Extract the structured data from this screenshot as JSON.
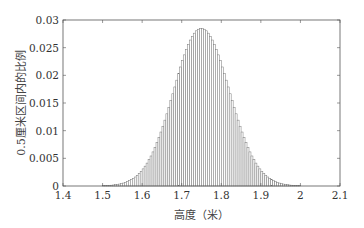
{
  "chart_data": {
    "type": "bar",
    "title": "",
    "xlabel": "高度（米）",
    "ylabel": "0.5厘米区间内的比例",
    "xlim": [
      1.4,
      2.1
    ],
    "ylim": [
      0,
      0.03
    ],
    "xticks": [
      "1.4",
      "1.5",
      "1.6",
      "1.7",
      "1.8",
      "1.9",
      "2",
      "2.1"
    ],
    "yticks": [
      "0",
      "0.005",
      "0.01",
      "0.015",
      "0.02",
      "0.025",
      "0.03"
    ],
    "grid": false,
    "legend": null,
    "distribution": {
      "shape": "normal",
      "mean": 1.75,
      "std": 0.07,
      "bin_width": 0.005,
      "range": [
        1.5,
        2.0
      ]
    },
    "peak": {
      "x": 1.75,
      "y": 0.0285
    }
  }
}
